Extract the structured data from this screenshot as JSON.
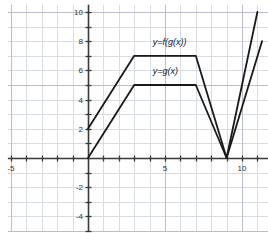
{
  "chart_data": {
    "type": "line",
    "title": "",
    "xlabel": "",
    "ylabel": "",
    "xlim": [
      -5.2,
      11.7
    ],
    "ylim": [
      -5.0,
      10.5
    ],
    "grid": true,
    "grid_step": 1,
    "major_grid_step": 5,
    "legend_position": "inline-annotations",
    "xticks": [
      -5,
      5,
      10
    ],
    "xtick_labels": [
      "-5",
      "5",
      "10"
    ],
    "yticks": [
      -4,
      -2,
      2,
      4,
      6,
      8,
      10
    ],
    "ytick_labels": [
      "-4",
      "-2",
      "2",
      "4",
      "6",
      "8",
      "10"
    ],
    "series": [
      {
        "name": "y=f(g(x))",
        "label": "y=f(g(x))",
        "color": "#1a1a1a",
        "x": [
          0,
          3,
          7,
          9,
          11
        ],
        "y": [
          2,
          7,
          7,
          0,
          10
        ]
      },
      {
        "name": "y=g(x)",
        "label": "y=g(x)",
        "color": "#1a1a1a",
        "x": [
          0,
          3,
          7,
          9,
          11.3
        ],
        "y": [
          0,
          5,
          5,
          0,
          8
        ]
      }
    ],
    "annotations": [
      {
        "text": "y=f(g(x))",
        "x": 4.2,
        "y": 7.9
      },
      {
        "text": "y=g(x)",
        "x": 4.2,
        "y": 5.9
      }
    ]
  },
  "axes": {
    "x_axis_name": "x-axis",
    "y_axis_name": "y-axis"
  },
  "colors": {
    "curve": "#1a1a1a",
    "axis": "#3a3a3a",
    "grid_minor": "#d8dce3",
    "grid_major": "#b9bec7",
    "background": "#ffffff",
    "tick_label": "#333333"
  }
}
